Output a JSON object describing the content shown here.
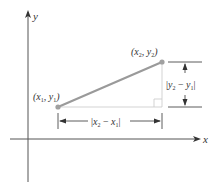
{
  "diagram": {
    "axes": {
      "x_label": "x",
      "y_label": "y"
    },
    "points": [
      {
        "name": "P1",
        "label_main_open": "(",
        "label_x": "x",
        "label_x_sub": "1",
        "label_sep": ", ",
        "label_y": "y",
        "label_y_sub": "1",
        "label_close": ")"
      },
      {
        "name": "P2",
        "label_main_open": "(",
        "label_x": "x",
        "label_x_sub": "2",
        "label_sep": ", ",
        "label_y": "y",
        "label_y_sub": "2",
        "label_close": ")"
      }
    ],
    "horizontal_distance": {
      "bar_left": "|",
      "a": "x",
      "a_sub": "2",
      "minus": " − ",
      "b": "x",
      "b_sub": "1",
      "bar_right": "|"
    },
    "vertical_distance": {
      "bar_left": "|",
      "a": "y",
      "a_sub": "2",
      "minus": " − ",
      "b": "y",
      "b_sub": "1",
      "bar_right": "|"
    },
    "colors": {
      "segment": "#9a9a9a",
      "axis": "#555555",
      "guide": "#c8c8c8",
      "text": "#333333"
    }
  }
}
